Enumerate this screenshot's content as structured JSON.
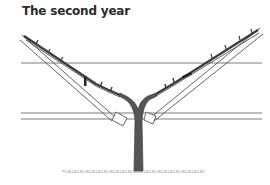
{
  "figure": {
    "title": "The second year",
    "colors": {
      "background": "#ffffff",
      "ink": "#3a3a3a",
      "wire": "#6e6e6e",
      "trunk": "#4a4a4a",
      "ground": "#9a9a9a"
    },
    "elements": {
      "upper_wire": "horizontal-wire",
      "lower_wires": "double-horizontal-wire",
      "left_arm": "left-trellis-arm-with-cane",
      "right_arm": "right-trellis-arm-with-cane",
      "trunk": "vine-trunk",
      "ground": "ground-line",
      "pruning_cuts": [
        "left-pruning-mark",
        "right-pruning-mark"
      ]
    }
  }
}
